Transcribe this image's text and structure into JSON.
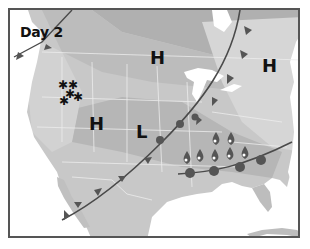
{
  "map": {
    "title": "Day 2",
    "pressure_systems": [
      {
        "type": "high",
        "label": "H",
        "x": 156,
        "y": 58
      },
      {
        "type": "high",
        "label": "H",
        "x": 268,
        "y": 66
      },
      {
        "type": "high",
        "label": "H",
        "x": 95,
        "y": 124
      },
      {
        "type": "low",
        "label": "L",
        "x": 143,
        "y": 131
      }
    ],
    "fronts": [
      {
        "type": "cold",
        "description": "Cold front arcing from Canada through Great Lakes to Southwest/Mexico"
      },
      {
        "type": "stationary",
        "description": "Warm-type front across Gulf Coast states"
      }
    ],
    "precipitation": [
      {
        "type": "snow",
        "region": "Northern Rockies",
        "count": 5
      },
      {
        "type": "rain",
        "region": "Southeast",
        "count": 7
      }
    ],
    "colors": {
      "frame": "#555555",
      "front": "#4a4a4a",
      "land_light": "#d8d8d8",
      "land_mid": "#bdbdbd",
      "land_dark": "#a8a8a8",
      "water": "#ffffff"
    }
  }
}
